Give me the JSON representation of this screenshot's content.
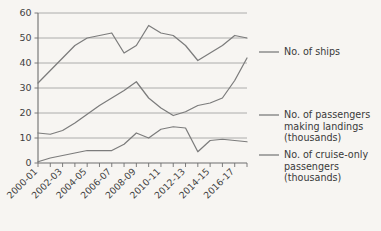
{
  "chart_data": {
    "type": "line",
    "title": "",
    "subtitle": "",
    "xlabel": "",
    "ylabel": "",
    "ylim": [
      0,
      60
    ],
    "yticks": [
      0,
      10,
      20,
      30,
      40,
      50,
      60
    ],
    "ytick_labels": [
      "0",
      "10",
      "20",
      "30",
      "40",
      "50",
      "60"
    ],
    "grid": true,
    "legend_position": "right",
    "x": [
      "2000-01",
      "2001-02",
      "2002-03",
      "2003-04",
      "2004-05",
      "2005-06",
      "2006-07",
      "2007-08",
      "2008-09",
      "2009-10",
      "2010-11",
      "2011-12",
      "2012-13",
      "2013-14",
      "2014-15",
      "2015-16",
      "2016-17",
      "2017-18"
    ],
    "xtick_labels": [
      "2000-01",
      "",
      "2002-03",
      "",
      "2004-05",
      "",
      "2006-07",
      "",
      "2008-09",
      "",
      "2010-11",
      "",
      "2012-13",
      "",
      "2014-15",
      "",
      "2016-17",
      ""
    ],
    "series": [
      {
        "name": "No. of ships",
        "color": "#7c7c7c",
        "values": [
          32,
          37,
          42,
          47,
          50,
          51,
          52,
          44,
          47,
          55,
          52,
          51,
          47,
          41,
          44,
          47,
          51,
          50
        ]
      },
      {
        "name": "No. of passengers making landings (thousands)",
        "color": "#7c7c7c",
        "values": [
          12,
          11.5,
          13,
          16,
          19.5,
          23,
          26,
          29,
          32.5,
          26,
          22,
          19,
          20.5,
          23,
          24,
          26,
          33,
          42
        ]
      },
      {
        "name": "No. of cruise-only passengers (thousands)",
        "color": "#7c7c7c",
        "values": [
          0.5,
          2,
          3,
          4,
          5,
          5,
          5,
          7.5,
          12,
          10,
          13.5,
          14.5,
          14,
          4.5,
          9,
          9.5,
          9,
          8.5
        ]
      }
    ]
  },
  "legend": {
    "entries": [
      {
        "label_lines": [
          "No. of ships"
        ]
      },
      {
        "label_lines": [
          "No. of passengers",
          "making landings",
          "(thousands)"
        ]
      },
      {
        "label_lines": [
          "No. of cruise-only",
          "passengers",
          "(thousands)"
        ]
      }
    ],
    "entry_0_line_0": "No. of ships",
    "entry_1_line_0": "No. of passengers",
    "entry_1_line_1": "making landings",
    "entry_1_line_2": "(thousands)",
    "entry_2_line_0": "No. of cruise-only",
    "entry_2_line_1": "passengers",
    "entry_2_line_2": "(thousands)"
  },
  "axis": {
    "y_labels": [
      "60",
      "50",
      "40",
      "30",
      "20",
      "10",
      "0"
    ],
    "x_labels": [
      "2000-01",
      "2002-03",
      "2004-05",
      "2006-07",
      "2008-09",
      "2010-11",
      "2012-13",
      "2014-15",
      "2016-17"
    ]
  },
  "colors": {
    "background": "#f7f5f2",
    "line": "#7c7c7c",
    "grid": "#9a9a9a",
    "axis": "#6f6f6f",
    "text": "#3a3a3a"
  }
}
